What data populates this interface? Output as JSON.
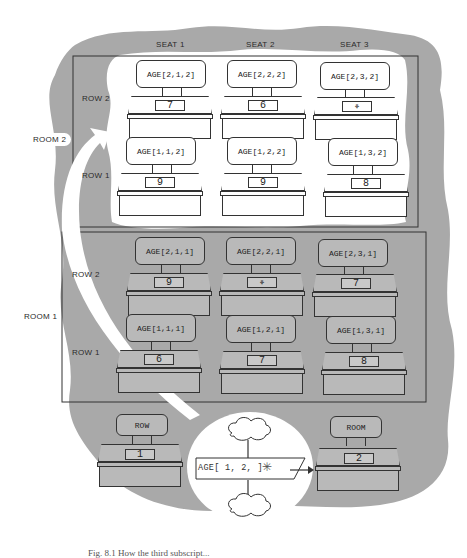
{
  "figure": {
    "caption": "Fig. 8.1 How the third subscript...",
    "colors": {
      "background": "#ffffff",
      "cloud_gray": "#a9a9a9",
      "room2_fill": "#ffffff",
      "room1_fill": "#a9a9a9",
      "line": "#333333"
    }
  },
  "headers": {
    "seat_labels": [
      "SEAT 1",
      "SEAT 2",
      "SEAT 3"
    ]
  },
  "room2": {
    "label": "ROOM 2",
    "row_labels": {
      "row2": "ROW 2",
      "row1": "ROW 1"
    },
    "seats": [
      {
        "chair": "AGE[2,1,2]",
        "value": "7"
      },
      {
        "chair": "AGE[2,2,2]",
        "value": "6"
      },
      {
        "chair": "AGE[2,3,2]",
        "value": "⚘",
        "empty": true
      },
      {
        "chair": "AGE[1,1,2]",
        "value": "9"
      },
      {
        "chair": "AGE[1,2,2]",
        "value": "9"
      },
      {
        "chair": "AGE[1,3,2]",
        "value": "8"
      }
    ]
  },
  "room1": {
    "label": "ROOM 1",
    "row_labels": {
      "row2": "ROW 2",
      "row1": "ROW 1"
    },
    "seats": [
      {
        "chair": "AGE[2,1,1]",
        "value": "9"
      },
      {
        "chair": "AGE[2,2,1]",
        "value": "⚘",
        "empty": true
      },
      {
        "chair": "AGE[2,3,1]",
        "value": "7"
      },
      {
        "chair": "AGE[1,1,1]",
        "value": "6"
      },
      {
        "chair": "AGE[1,2,1]",
        "value": "7"
      },
      {
        "chair": "AGE[1,3,1]",
        "value": "8"
      }
    ]
  },
  "bottom": {
    "row_desk": {
      "chair": "ROW",
      "value": "1"
    },
    "room_desk": {
      "chair": "ROOM",
      "value": "2"
    },
    "subscript_expression": "AGE[ 1, 2,    ]",
    "blank_marker": "✳"
  }
}
